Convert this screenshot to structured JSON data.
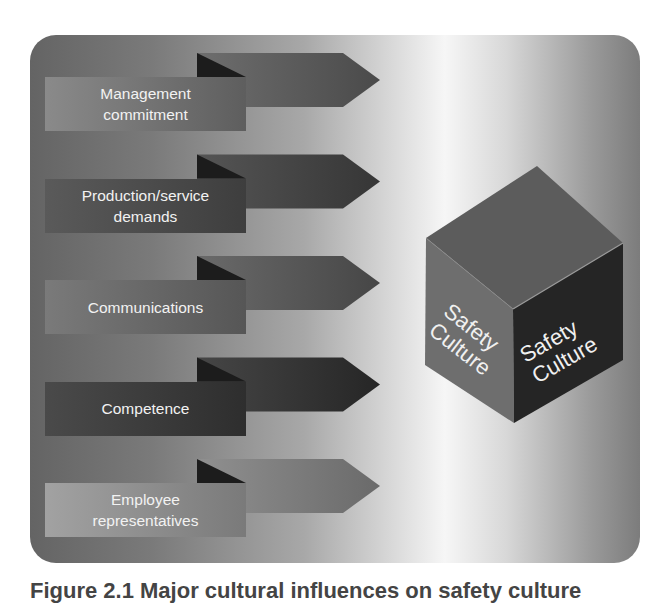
{
  "diagram": {
    "influences": [
      {
        "lines": [
          "Management",
          "commitment"
        ],
        "box": [
          "#8a8a8a",
          "#5e5e5e"
        ],
        "arrow": [
          "#6e6e6e",
          "#4a4a4a"
        ]
      },
      {
        "lines": [
          "Production/service",
          "demands"
        ],
        "box": [
          "#5a5a5a",
          "#3e3e3e"
        ],
        "arrow": [
          "#555555",
          "#363636"
        ]
      },
      {
        "lines": [
          "Communications"
        ],
        "box": [
          "#7a7a7a",
          "#565656"
        ],
        "arrow": [
          "#6a6a6a",
          "#464646"
        ]
      },
      {
        "lines": [
          "Competence"
        ],
        "box": [
          "#4a4a4a",
          "#2e2e2e"
        ],
        "arrow": [
          "#464646",
          "#262626"
        ]
      },
      {
        "lines": [
          "Employee",
          "representatives"
        ],
        "box": [
          "#a2a2a2",
          "#7a7a7a"
        ],
        "arrow": [
          "#909090",
          "#6a6a6a"
        ]
      }
    ],
    "cube": {
      "left_face": [
        "Safety",
        "Culture"
      ],
      "right_face": [
        "Safety",
        "Culture"
      ],
      "colors": {
        "top": "#5c5c5c",
        "left": "#6e6e6e",
        "right": "#252525"
      }
    }
  },
  "caption": "Figure 2.1 Major cultural influences on safety culture"
}
